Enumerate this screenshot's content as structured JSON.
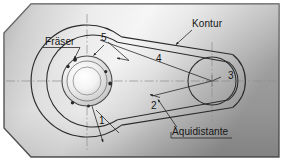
{
  "figure": {
    "type": "technical-diagram",
    "language": "de",
    "background": {
      "fill_light": "#f2f2f2",
      "fill_mid": "#c9c9c9",
      "fill_dark": "#8f8f8f",
      "border": "#4a4a4a",
      "chamfer_corners": [
        "top-left",
        "bottom-left"
      ]
    },
    "line_color": "#2a2a2a",
    "centerline_color": "#8a8a8a"
  },
  "labels": {
    "cutter": "Fräser",
    "contour": "Kontur",
    "equidistant": "Äquidistante"
  },
  "callouts": [
    {
      "id": "1",
      "text": "1"
    },
    {
      "id": "2",
      "text": "2"
    },
    {
      "id": "3",
      "text": "3"
    },
    {
      "id": "4",
      "text": "4"
    },
    {
      "id": "5",
      "text": "5"
    }
  ],
  "geometry": {
    "left_circle": {
      "cx": 87,
      "cy": 81,
      "r_contour": 56,
      "r_equidistant": 46
    },
    "right_circle": {
      "cx": 212,
      "cy": 81,
      "r_contour": 34,
      "r_equidistant": 24
    },
    "cutter": {
      "cx": 87,
      "cy": 81,
      "r_outer": 25,
      "r_mid": 20,
      "r_inner": 14
    },
    "centerline_horizontal_y": 81,
    "centerline_vertical_x": 87
  }
}
